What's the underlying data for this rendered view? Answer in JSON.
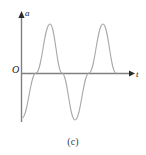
{
  "figure": {
    "caption": "(c)",
    "background_color": "#ffffff",
    "axis_color": "#808080",
    "curve_color": "#a8a8a8",
    "label_color": "#1a1a1a"
  },
  "axes": {
    "vertical": {
      "label": "a",
      "arrow": "up-arrow-icon",
      "x_px": 21,
      "top_px": 13,
      "bottom_px": 122
    },
    "horizontal": {
      "label": "t",
      "arrow": "right-arrow-icon",
      "y_px": 73,
      "left_px": 21,
      "right_px": 134
    },
    "origin_label": "O"
  },
  "chart_data": {
    "type": "line",
    "title": "(c)",
    "xlabel": "t",
    "ylabel": "a",
    "grid": false,
    "legend": null,
    "axis_ticks": [],
    "xlim": [
      0,
      113
    ],
    "ylim": [
      -49,
      49
    ],
    "series": [
      {
        "name": "a(t)",
        "color": "#a8a8a8",
        "x": [
          0,
          4,
          8,
          12,
          15,
          19,
          23,
          27,
          29,
          34,
          38,
          41,
          45,
          48,
          52,
          56,
          60,
          64,
          68,
          72,
          75,
          79,
          82,
          86,
          90,
          95
        ],
        "y": [
          -45,
          -36,
          -22,
          -6,
          11,
          27,
          40,
          47,
          49,
          44,
          32,
          16,
          -2,
          -19,
          -34,
          -44,
          -49,
          -47,
          -38,
          -23,
          -6,
          12,
          28,
          41,
          48,
          0
        ],
        "zero_crossings_px": [
          36,
          62,
          89,
          116
        ],
        "peaks_px": [
          [
            50,
            24
          ],
          [
            103,
            24
          ]
        ],
        "troughs_px": [
          [
            75,
            120
          ]
        ],
        "start_px": [
          22,
          118
        ],
        "end_px": [
          116,
          73
        ]
      }
    ]
  }
}
